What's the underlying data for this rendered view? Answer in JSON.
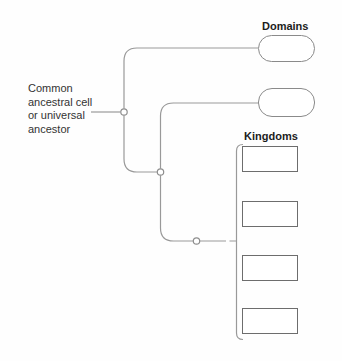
{
  "diagram": {
    "title_none": "",
    "root": {
      "label_lines": {
        "0": "Common",
        "1": "ancestral cell",
        "2": "or universal",
        "3": "ancestor"
      }
    },
    "domains": {
      "label": "Domains",
      "boxes": [
        {
          "value": ""
        },
        {
          "value": ""
        }
      ]
    },
    "kingdoms": {
      "label": "Kingdoms",
      "boxes": [
        {
          "value": ""
        },
        {
          "value": ""
        },
        {
          "value": ""
        },
        {
          "value": ""
        }
      ]
    },
    "colors": {
      "background": "#fefefe",
      "tree_line": "#999999",
      "node_stroke": "#8e8e8e",
      "node_fill": "#ffffff",
      "pill_border": "#8a8a8a",
      "box_border": "#6d6d6d",
      "label_text": "#1c1c1c",
      "body_text": "#333333"
    }
  }
}
